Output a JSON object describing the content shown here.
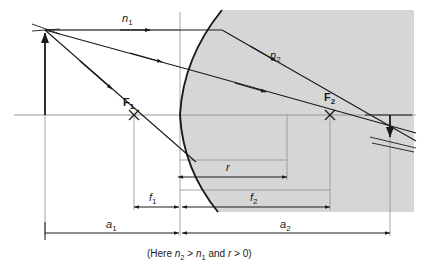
{
  "figure": {
    "caption": "(Here n2 > n1 and r > 0)",
    "caption_parts": {
      "open": "(Here ",
      "n2_base": "n",
      "n2_sub": "2",
      "gt1": " > ",
      "n1_base": "n",
      "n1_sub": "1",
      "and": " and ",
      "r": "r",
      "gt2": " > 0)"
    },
    "colors": {
      "medium_fill": "#d6d6d6",
      "line": "#1a1a1a",
      "thin_line": "#8a8a8a",
      "background": "#ffffff"
    },
    "labels": {
      "n1": {
        "base": "n",
        "sub": "1"
      },
      "n2": {
        "base": "n",
        "sub": "2"
      },
      "f1": {
        "base": "f",
        "sub": "1"
      },
      "f2": {
        "base": "f",
        "sub": "2"
      },
      "a1": {
        "base": "a",
        "sub": "1"
      },
      "a2": {
        "base": "a",
        "sub": "2"
      },
      "r": {
        "base": "r",
        "sub": ""
      },
      "F1": {
        "base": "F",
        "sub": "1"
      },
      "F2": {
        "base": "F",
        "sub": "2"
      }
    },
    "dimensions": [
      {
        "name": "r",
        "from_x": 178,
        "to_x": 287,
        "y": 177
      },
      {
        "name": "f1",
        "from_x": 134,
        "to_x": 180,
        "y": 207
      },
      {
        "name": "f2",
        "from_x": 181,
        "to_x": 330,
        "y": 207
      },
      {
        "name": "a1",
        "from_x": 45,
        "to_x": 179,
        "y": 233
      },
      {
        "name": "a2",
        "from_x": 181,
        "to_x": 390,
        "y": 233
      }
    ],
    "points": {
      "object_base_x": 45,
      "object_tip_y": 30,
      "axis_y": 115,
      "vertex_x": 180,
      "F1_x": 134,
      "F2_x": 330,
      "center_x": 287,
      "image_x": 390,
      "image_tip_y": 140
    }
  }
}
